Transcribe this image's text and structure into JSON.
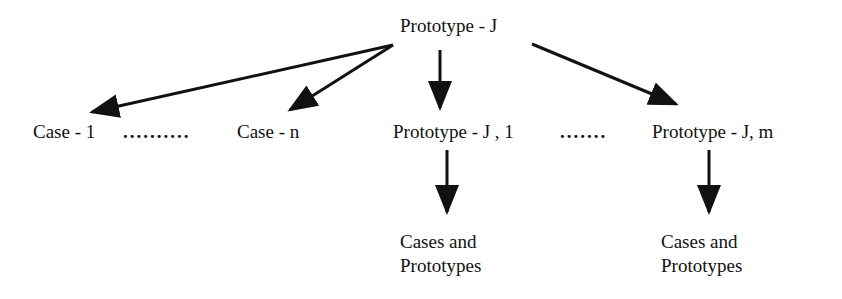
{
  "diagram": {
    "root": {
      "label": "Prototype - J"
    },
    "level1": {
      "cases": [
        {
          "label": "Case - 1"
        },
        {
          "label": "Case - n"
        }
      ],
      "cases_ellipsis": "..........",
      "prototypes": [
        {
          "label": "Prototype - J , 1"
        },
        {
          "label": "Prototype - J, m"
        }
      ],
      "prototypes_ellipsis": "......."
    },
    "level2": [
      {
        "line1": "Cases and",
        "line2": "Prototypes",
        "parent": "Prototype - J , 1"
      },
      {
        "line1": "Cases and",
        "line2": "Prototypes",
        "parent": "Prototype - J, m"
      }
    ],
    "edges": [
      {
        "from": "Prototype - J",
        "to": "Case - 1"
      },
      {
        "from": "Prototype - J",
        "to": "Case - n"
      },
      {
        "from": "Prototype - J",
        "to": "Prototype - J , 1"
      },
      {
        "from": "Prototype - J",
        "to": "Prototype - J, m"
      },
      {
        "from": "Prototype - J , 1",
        "to": "Cases and Prototypes"
      },
      {
        "from": "Prototype - J, m",
        "to": "Cases and Prototypes"
      }
    ],
    "colors": {
      "ink": "#111111",
      "background": "#ffffff"
    }
  }
}
